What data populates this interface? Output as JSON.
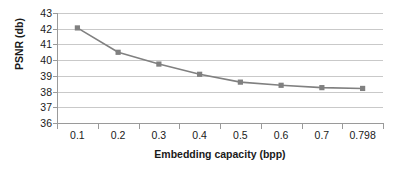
{
  "chart_data": {
    "type": "line",
    "title": "",
    "xlabel": "Embedding capacity (bpp)",
    "ylabel": "PSNR (db)",
    "categories": [
      "0.1",
      "0.2",
      "0.3",
      "0.4",
      "0.5",
      "0.6",
      "0.7",
      "0.798"
    ],
    "values": [
      42.05,
      40.5,
      39.75,
      39.1,
      38.6,
      38.4,
      38.25,
      38.2
    ],
    "ylim": [
      36,
      43
    ],
    "y_ticks": [
      43,
      42,
      41,
      40,
      39,
      38,
      37,
      36
    ],
    "grid": true,
    "legend": "none",
    "series_color": "#808080",
    "marker": "square",
    "gridline_color": "#c9c9c9",
    "axis_color": "#9a9a9a",
    "text_color": "#1a1a1a"
  }
}
